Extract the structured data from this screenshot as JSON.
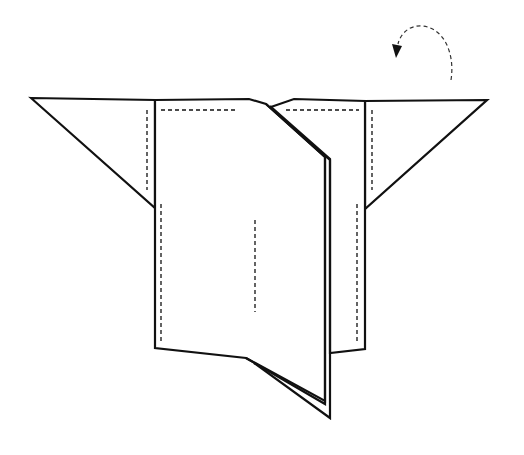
{
  "diagram": {
    "type": "origami-fold-step",
    "colors": {
      "line": "#111111",
      "background": "#ffffff"
    },
    "symbols": {
      "turn_over_arrow": "curved-dashed-arrow-icon"
    }
  }
}
